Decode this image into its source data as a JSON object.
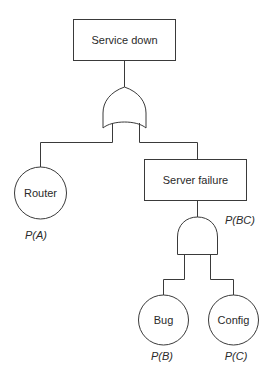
{
  "diagram": {
    "type": "fault-tree",
    "top_event": {
      "label": "Service down",
      "gate": "OR"
    },
    "intermediate_event": {
      "label": "Server failure",
      "gate": "AND",
      "probability": "P(BC)"
    },
    "basic_events": [
      {
        "label": "Router",
        "probability": "P(A)"
      },
      {
        "label": "Bug",
        "probability": "P(B)"
      },
      {
        "label": "Config",
        "probability": "P(C)"
      }
    ],
    "colors": {
      "line": "#3a3a3a",
      "text": "#2a2a2a",
      "background": "#ffffff"
    }
  }
}
